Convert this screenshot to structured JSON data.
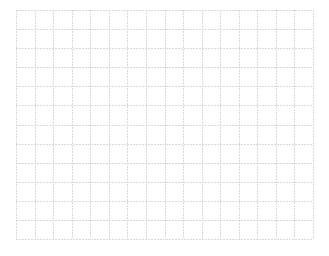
{
  "canvas": {
    "background": "#ffffff",
    "width": 329,
    "height": 256
  },
  "grid": {
    "columns": 16,
    "rows": 12,
    "left": 16,
    "top": 10,
    "width": 297,
    "height": 229,
    "line_color": "#d9d9d9",
    "line_width": 1,
    "line_style": "dotted"
  }
}
